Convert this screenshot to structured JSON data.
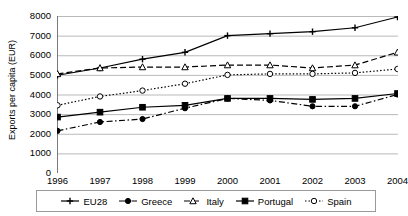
{
  "chart_data": {
    "type": "line",
    "title": "",
    "xlabel": "",
    "ylabel": "Exports per capita (EUR)",
    "categories": [
      "1996",
      "1997",
      "1998",
      "1999",
      "2000",
      "2001",
      "2002",
      "2003",
      "2004"
    ],
    "x": [
      1996,
      1997,
      1998,
      1999,
      2000,
      2001,
      2002,
      2003,
      2004
    ],
    "ylim": [
      0,
      8000
    ],
    "yticks": [
      8000,
      7000,
      6000,
      5000,
      4000,
      3000,
      2000,
      1000,
      0
    ],
    "grid": "horizontal",
    "legend_position": "bottom",
    "series": [
      {
        "name": "EU28",
        "marker": "plus",
        "linestyle": "solid",
        "color": "#000000",
        "values": [
          4980,
          5350,
          5800,
          6150,
          7000,
          7100,
          7200,
          7400,
          7950
        ]
      },
      {
        "name": "Greece",
        "marker": "filled-circle",
        "linestyle": "dash-dot",
        "color": "#000000",
        "values": [
          2150,
          2600,
          2750,
          3300,
          3800,
          3700,
          3400,
          3400,
          4000
        ]
      },
      {
        "name": "Italy",
        "marker": "triangle",
        "linestyle": "dashed",
        "color": "#000000",
        "values": [
          5050,
          5350,
          5400,
          5400,
          5500,
          5500,
          5350,
          5500,
          6150
        ]
      },
      {
        "name": "Portugal",
        "marker": "filled-square",
        "linestyle": "solid",
        "color": "#000000",
        "values": [
          2850,
          3100,
          3350,
          3450,
          3800,
          3800,
          3750,
          3800,
          4050
        ]
      },
      {
        "name": "Spain",
        "marker": "open-circle",
        "linestyle": "dotted",
        "color": "#000000",
        "values": [
          3450,
          3900,
          4200,
          4550,
          5000,
          5050,
          5050,
          5100,
          5300
        ]
      }
    ]
  }
}
